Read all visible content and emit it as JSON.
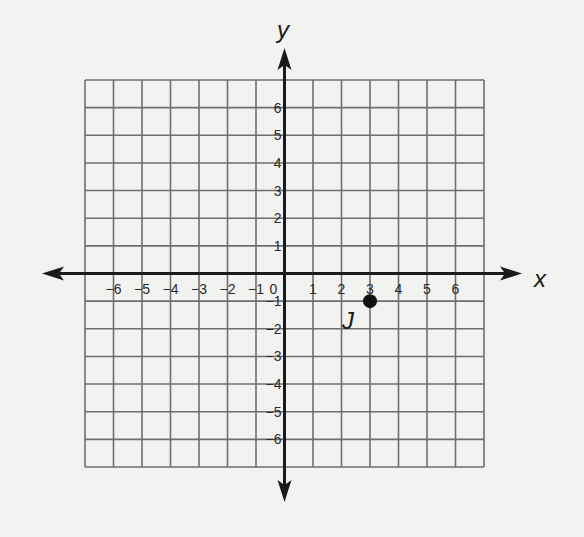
{
  "chart_data": {
    "type": "scatter",
    "title": "",
    "xlabel": "x",
    "ylabel": "y",
    "xlim": [
      -7,
      7
    ],
    "ylim": [
      -7,
      7
    ],
    "grid": true,
    "x_ticks": [
      "-6",
      "-5",
      "-4",
      "-3",
      "-2",
      "-1",
      "0",
      "1",
      "2",
      "3",
      "4",
      "5",
      "6"
    ],
    "y_ticks": [
      "6",
      "5",
      "4",
      "3",
      "2",
      "1",
      "-1",
      "-2",
      "-3",
      "-4",
      "-5",
      "-6"
    ],
    "points": [
      {
        "label": "J",
        "x": 3,
        "y": -1
      }
    ]
  },
  "colors": {
    "grid": "#6e6e6e",
    "axis": "#1a1a1a",
    "point": "#111111",
    "background": "#f2f2f0"
  }
}
